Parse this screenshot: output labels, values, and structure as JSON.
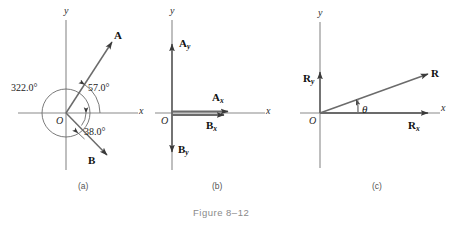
{
  "figure": {
    "caption": "Figure 8–12",
    "background_color": "#ffffff",
    "line_color": "#6b6b6b",
    "text_color": "#1b1b1b"
  },
  "panels": [
    {
      "id": "a",
      "label": "(a)",
      "axes": {
        "x_label": "x",
        "y_label": "y",
        "origin_label": "O"
      },
      "vectors": [
        {
          "name": "A",
          "label": "A",
          "direction": "up-right"
        },
        {
          "name": "B",
          "label": "B",
          "direction": "down-right"
        }
      ],
      "angles": [
        {
          "name": "angle-A",
          "value": "57.0°"
        },
        {
          "name": "angle-B",
          "value": "38.0°"
        },
        {
          "name": "angle-full",
          "value": "322.0°"
        }
      ]
    },
    {
      "id": "b",
      "label": "(b)",
      "axes": {
        "x_label": "x",
        "y_label": "y",
        "origin_label": "O"
      },
      "vectors": [
        {
          "name": "Ay",
          "base": "A",
          "sub": "y",
          "direction": "up"
        },
        {
          "name": "Ax",
          "base": "A",
          "sub": "x",
          "direction": "right"
        },
        {
          "name": "Bx",
          "base": "B",
          "sub": "x",
          "direction": "right"
        },
        {
          "name": "By",
          "base": "B",
          "sub": "y",
          "direction": "down"
        }
      ]
    },
    {
      "id": "c",
      "label": "(c)",
      "axes": {
        "x_label": "x",
        "y_label": "y",
        "origin_label": "O"
      },
      "vectors": [
        {
          "name": "Ry",
          "base": "R",
          "sub": "y",
          "direction": "up"
        },
        {
          "name": "Rx",
          "base": "R",
          "sub": "x",
          "direction": "right"
        },
        {
          "name": "R",
          "base": "R",
          "sub": "",
          "direction": "up-right"
        }
      ],
      "angles": [
        {
          "name": "angle-theta",
          "value": "θ"
        }
      ]
    }
  ]
}
